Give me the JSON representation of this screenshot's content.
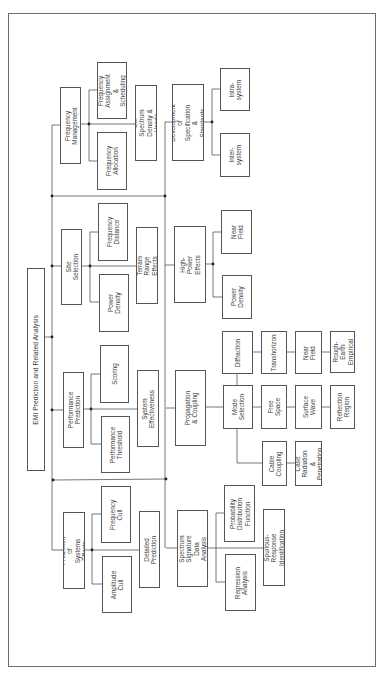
{
  "diagram": {
    "title": "EMI Prediction and Related Analysis",
    "orientation": "rotated 90 degrees counterclockwise",
    "branches": [
      {
        "label": "Frequency Management",
        "children": [
          "Frequency Allocation",
          "Frequency Assignment & Scheduling",
          "EM Spectrum Density & Usage"
        ]
      },
      {
        "label": "Site Selection",
        "children": [
          "Power Density",
          "Frequency Distance",
          "Terrain Range Effects"
        ]
      },
      {
        "label": "Performance Prediction",
        "children": [
          "Performance Threshold",
          "Scoring",
          "System Effectiveness"
        ]
      },
      {
        "label": "Prediction of Systems Effects",
        "children": [
          "Amplitude Cull",
          "Frequency Cull",
          "Detailed Prediction"
        ]
      },
      {
        "label": "Development of Specification & Standards",
        "children": [
          "Inter-system",
          "Intra-system"
        ]
      },
      {
        "label": "High-Power Effects",
        "children": [
          "Power Density",
          "Near Field"
        ]
      },
      {
        "label": "Propagation & Coupling",
        "children": [
          {
            "label": "Mode Selection",
            "children": [
              {
                "label": "Diffraction",
                "chain": [
                  "Transhorizon",
                  "Near Field",
                  "Rough-Earth Empirical"
                ]
              },
              {
                "label": "Free Space",
                "chain": [
                  "Surface Wave",
                  "Reflection Region"
                ]
              },
              {
                "label": "Cable Coupling",
                "chain": [
                  "Case Radiation & Penetration"
                ]
              }
            ]
          }
        ]
      },
      {
        "label": "Spectrum Signature Data Analysis",
        "children": [
          "Regression Analysis",
          "Probability Distribution Function",
          "Spurious-Response Identification"
        ]
      }
    ]
  },
  "boxes": {
    "title": "EMI Prediction and Related Analysis",
    "freq_mgmt": "Frequency\nManagement",
    "freq_assign": "Frequency\nAssignment\n& Scheduling",
    "freq_alloc": "Frequency\nAllocation",
    "em_spectrum": "EM Spectrum\nDensity & Usage",
    "dev_spec": "Development of\nSpecification &\nStandards",
    "intra": "Intra-\nsystem",
    "inter": "Inter-\nsystem",
    "freq_dist": "Frequency\nDistance",
    "site_sel": "Site\nSelection",
    "power_density_site": "Power\nDensity",
    "terrain": "Terrain\nRange Effects",
    "high_power": "High-Power\nEffects",
    "near_field_hp": "Near\nField",
    "power_density_hp": "Power\nDensity",
    "diffraction": "Diffraction",
    "transhorizon": "Transhorizon",
    "near_field": "Near Field",
    "rough_earth": "Rough-Earth\nEmpirical",
    "scoring": "Scoring",
    "perf_pred": "Performance\nPrediction",
    "sys_eff": "System\nEffectiveness",
    "perf_thresh": "Performance\nThreshold",
    "prop_coupling": "Propagation\n& Coupling",
    "mode_sel": "Mode\nSelection",
    "free_space": "Free Space",
    "surface_wave": "Surface\nWave",
    "reflection": "Reflection\nRegion",
    "cable_coupling": "Cable\nCoupling",
    "case_rad": "Case\nRadiation &\nPenetration",
    "freq_cull": "Frequency\nCull",
    "pred_sys": "Prediction of\nSystems Effects",
    "amp_cull": "Amplitude\nCull",
    "detailed": "Detailed\nPrediction",
    "spectrum_sig": "Spectrum Signature\nData Analysis",
    "prob_dist": "Probability\nDistribution\nFunction",
    "regression": "Regression\nAnalysis",
    "spurious": "Spurious-Response\nIdentification"
  },
  "colors": {
    "line": "#555555",
    "frame": "#6e6e6e",
    "text": "#3d3d3d",
    "background": "#ffffff"
  }
}
